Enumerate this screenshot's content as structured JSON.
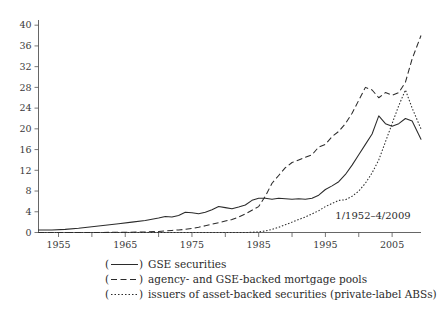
{
  "chart_data": {
    "type": "line",
    "title": "",
    "subtitle": "",
    "xlabel": "",
    "ylabel": "",
    "annotation": "1/1952–4/2009",
    "grid": false,
    "legend_position": "below-center",
    "xlim": [
      1952,
      2009.33
    ],
    "ylim": [
      0,
      41
    ],
    "y_ticks": [
      0,
      4,
      8,
      12,
      16,
      20,
      24,
      28,
      32,
      36,
      40
    ],
    "y_tick_labels": [
      "0",
      "4",
      "8",
      "12",
      "16",
      "20",
      "24",
      "28",
      "32",
      "36",
      "40"
    ],
    "x_ticks_major": [
      1955,
      1965,
      1975,
      1985,
      1995,
      2005
    ],
    "x_tick_labels": [
      "1955",
      "1965",
      "1975",
      "1985",
      "1995",
      "2005"
    ],
    "x_ticks_minor": [
      1960,
      1970,
      1980,
      1990,
      2000
    ],
    "series": [
      {
        "name": "GSE securities",
        "legend_label": "GSE securities",
        "legend_marker": "(——)",
        "style": "solid",
        "x": [
          1952,
          1954,
          1956,
          1958,
          1960,
          1962,
          1964,
          1966,
          1968,
          1970,
          1971,
          1972,
          1973,
          1974,
          1975,
          1976,
          1977,
          1978,
          1979,
          1980,
          1981,
          1982,
          1983,
          1984,
          1985,
          1986,
          1987,
          1988,
          1989,
          1990,
          1991,
          1992,
          1993,
          1994,
          1995,
          1996,
          1997,
          1998,
          1999,
          2000,
          2001,
          2002,
          2003,
          2004,
          2005,
          2006,
          2007,
          2008,
          2009.33
        ],
        "values": [
          0.5,
          0.5,
          0.6,
          0.8,
          1.1,
          1.4,
          1.7,
          2.0,
          2.3,
          2.8,
          3.1,
          3.0,
          3.3,
          3.9,
          3.8,
          3.6,
          3.9,
          4.4,
          5.0,
          4.8,
          4.6,
          4.9,
          5.3,
          6.2,
          6.6,
          6.6,
          6.4,
          6.6,
          6.5,
          6.4,
          6.5,
          6.4,
          6.6,
          7.2,
          8.3,
          9.0,
          9.8,
          11.2,
          13.0,
          15.0,
          17.0,
          19.0,
          22.5,
          21.0,
          20.5,
          21.0,
          22.0,
          21.5,
          18.0
        ]
      },
      {
        "name": "agency- and GSE-backed mortgage pools",
        "legend_label": "agency- and GSE-backed mortgage pools",
        "legend_marker": "(— —)",
        "style": "dashed",
        "x": [
          1952,
          1960,
          1965,
          1968,
          1970,
          1971,
          1972,
          1973,
          1974,
          1975,
          1976,
          1977,
          1978,
          1979,
          1980,
          1981,
          1982,
          1983,
          1984,
          1985,
          1986,
          1987,
          1988,
          1989,
          1990,
          1991,
          1992,
          1993,
          1994,
          1995,
          1996,
          1997,
          1998,
          1999,
          2000,
          2001,
          2002,
          2003,
          2004,
          2005,
          2006,
          2007,
          2008,
          2009.33
        ],
        "values": [
          0.0,
          0.0,
          0.05,
          0.1,
          0.2,
          0.3,
          0.4,
          0.5,
          0.6,
          0.8,
          1.0,
          1.3,
          1.6,
          1.9,
          2.2,
          2.5,
          3.0,
          3.6,
          4.3,
          5.0,
          7.0,
          9.5,
          11.0,
          12.5,
          13.5,
          14.0,
          14.5,
          15.0,
          16.5,
          17.0,
          18.5,
          19.5,
          21.0,
          23.0,
          25.5,
          28.0,
          27.5,
          26.0,
          27.0,
          26.5,
          27.0,
          29.0,
          33.5,
          38.0
        ]
      },
      {
        "name": "issuers of asset-backed securities (private-label ABSs)",
        "legend_label": "issuers of asset-backed securities (private-label ABSs)",
        "legend_marker": "(- - - -)",
        "style": "dotted",
        "x": [
          1952,
          1975,
          1980,
          1983,
          1984,
          1985,
          1986,
          1987,
          1988,
          1989,
          1990,
          1991,
          1992,
          1993,
          1994,
          1995,
          1996,
          1997,
          1998,
          1999,
          2000,
          2001,
          2002,
          2003,
          2004,
          2005,
          2006,
          2007,
          2008,
          2009.33
        ],
        "values": [
          0.0,
          0.0,
          0.0,
          0.0,
          0.05,
          0.1,
          0.3,
          0.6,
          1.0,
          1.5,
          2.0,
          2.5,
          3.0,
          3.6,
          4.2,
          5.0,
          5.6,
          6.2,
          6.3,
          7.0,
          8.0,
          9.5,
          11.5,
          14.0,
          17.5,
          21.0,
          24.5,
          27.5,
          24.0,
          20.0
        ]
      }
    ]
  },
  "legend": {
    "rows": [
      {
        "marker_open": "(",
        "marker_close": ")",
        "label": "GSE securities",
        "style": "solid"
      },
      {
        "marker_open": "(",
        "marker_close": ")",
        "label": "agency- and GSE-backed mortgage pools",
        "style": "dashed"
      },
      {
        "marker_open": "(",
        "marker_close": ")",
        "label": "issuers of asset-backed securities (private-label ABSs)",
        "style": "dotted"
      }
    ]
  },
  "colors": {
    "background": "#ffffff",
    "axis": "#555555",
    "ink": "#2b2b2b",
    "tick_text": "#3a3a3a"
  }
}
